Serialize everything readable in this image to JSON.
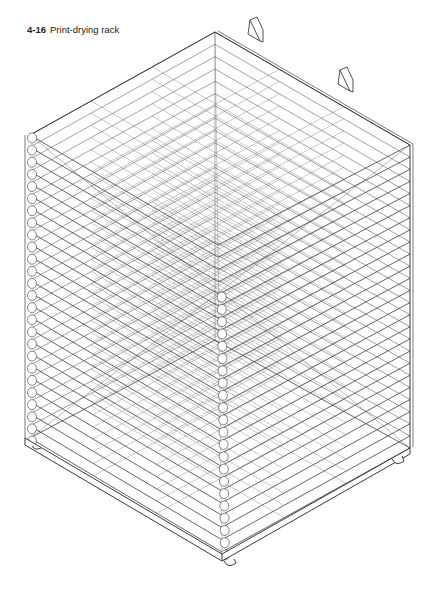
{
  "caption": {
    "number": "4-16",
    "title": "Print-drying rack"
  },
  "figure": {
    "view": "isometric line drawing",
    "shelf_count": 26,
    "line_color": "#222222",
    "background": "#ffffff"
  }
}
